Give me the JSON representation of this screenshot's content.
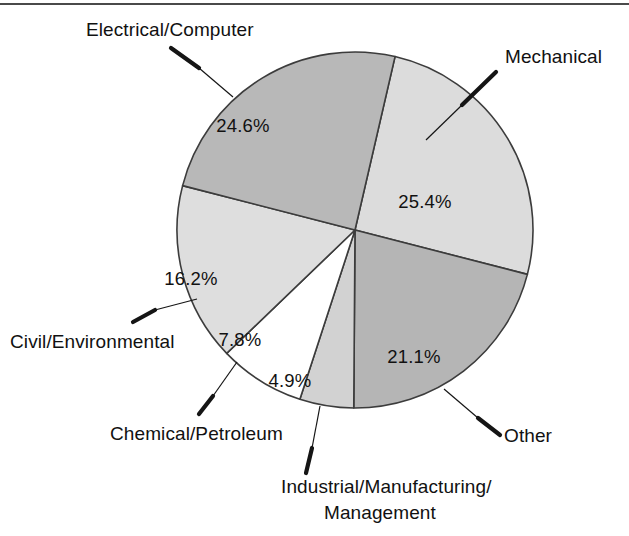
{
  "figure": {
    "name": "engineering-discipline-pie-chart",
    "has_top_rule": true,
    "background_color": "#ffffff"
  },
  "chart_data": {
    "type": "pie",
    "title": "",
    "subtitle": "",
    "xlabel": "",
    "ylabel": "",
    "legend_position": "none",
    "grid": false,
    "units": "percent",
    "total": 100.0,
    "start_angle_deg": 13,
    "direction": "clockwise",
    "categories": [
      "Mechanical",
      "Other",
      "Industrial/Manufacturing/ Management",
      "Chemical/Petroleum",
      "Civil/Environmental",
      "Electrical/Computer"
    ],
    "values": [
      25.4,
      21.1,
      4.9,
      7.8,
      16.2,
      24.6
    ],
    "labels": [
      "25.4%",
      "21.1%",
      "4.9%",
      "7.8%",
      "16.2%",
      "24.6%"
    ],
    "colors": [
      "#dcdcdc",
      "#b5b5b5",
      "#d2d2d2",
      "#ffffff",
      "#dedede",
      "#b8b8b8"
    ],
    "slices": [
      {
        "id": "mechanical",
        "name": "Mechanical",
        "value": 25.4,
        "label": "25.4%",
        "color": "#dcdcdc",
        "start_deg": 13,
        "end_deg": 104.44,
        "pct_x": 425,
        "pct_y": 208,
        "leader_label_x": 505,
        "leader_label_y": 63,
        "leader_from_x": 496,
        "leader_from_y": 72,
        "leader_mid_x": 462,
        "leader_mid_y": 105,
        "leader_to_x": 426,
        "leader_to_y": 140
      },
      {
        "id": "other",
        "name": "Other",
        "value": 21.1,
        "label": "21.1%",
        "color": "#b5b5b5",
        "start_deg": 104.44,
        "end_deg": 180.4,
        "pct_x": 414,
        "pct_y": 363,
        "leader_label_x": 504,
        "leader_label_y": 442,
        "leader_from_x": 500,
        "leader_from_y": 435,
        "leader_mid_x": 478,
        "leader_mid_y": 418,
        "leader_to_x": 444,
        "leader_to_y": 389
      },
      {
        "id": "industrial-manufacturing-management",
        "name": "Industrial/Manufacturing/",
        "name_line2": "Management",
        "value": 4.9,
        "label": "4.9%",
        "color": "#d2d2d2",
        "start_deg": 180.4,
        "end_deg": 198.04,
        "pct_x": 290,
        "pct_y": 387,
        "leader_label_x": 281,
        "leader_label_y": 493,
        "leader_label2_x": 324,
        "leader_label2_y": 519,
        "leader_from_x": 306,
        "leader_from_y": 473,
        "leader_mid_x": 312,
        "leader_mid_y": 448,
        "leader_to_x": 320,
        "leader_to_y": 406
      },
      {
        "id": "chemical-petroleum",
        "name": "Chemical/Petroleum",
        "value": 7.8,
        "label": "7.8%",
        "color": "#ffffff",
        "start_deg": 198.04,
        "end_deg": 226.12,
        "pct_x": 240,
        "pct_y": 346,
        "leader_label_x": 110,
        "leader_label_y": 440,
        "leader_from_x": 199,
        "leader_from_y": 414,
        "leader_mid_x": 213,
        "leader_mid_y": 396,
        "leader_to_x": 237,
        "leader_to_y": 362
      },
      {
        "id": "civil-environmental",
        "name": "Civil/Environmental",
        "value": 16.2,
        "label": "16.2%",
        "color": "#dedede",
        "start_deg": 226.12,
        "end_deg": 284.44,
        "pct_x": 191,
        "pct_y": 285,
        "leader_label_x": 10,
        "leader_label_y": 348,
        "leader_from_x": 133,
        "leader_from_y": 322,
        "leader_mid_x": 155,
        "leader_mid_y": 310,
        "leader_to_x": 197,
        "leader_to_y": 299
      },
      {
        "id": "electrical-computer",
        "name": "Electrical/Computer",
        "value": 24.6,
        "label": "24.6%",
        "color": "#b8b8b8",
        "start_deg": 284.44,
        "end_deg": 373,
        "pct_x": 243,
        "pct_y": 132,
        "leader_label_x": 86,
        "leader_label_y": 36,
        "leader_from_x": 171,
        "leader_from_y": 48,
        "leader_mid_x": 199,
        "leader_mid_y": 68,
        "leader_to_x": 233,
        "leader_to_y": 97
      }
    ],
    "geometry": {
      "center_x": 355,
      "center_y": 230,
      "radius": 178
    }
  }
}
